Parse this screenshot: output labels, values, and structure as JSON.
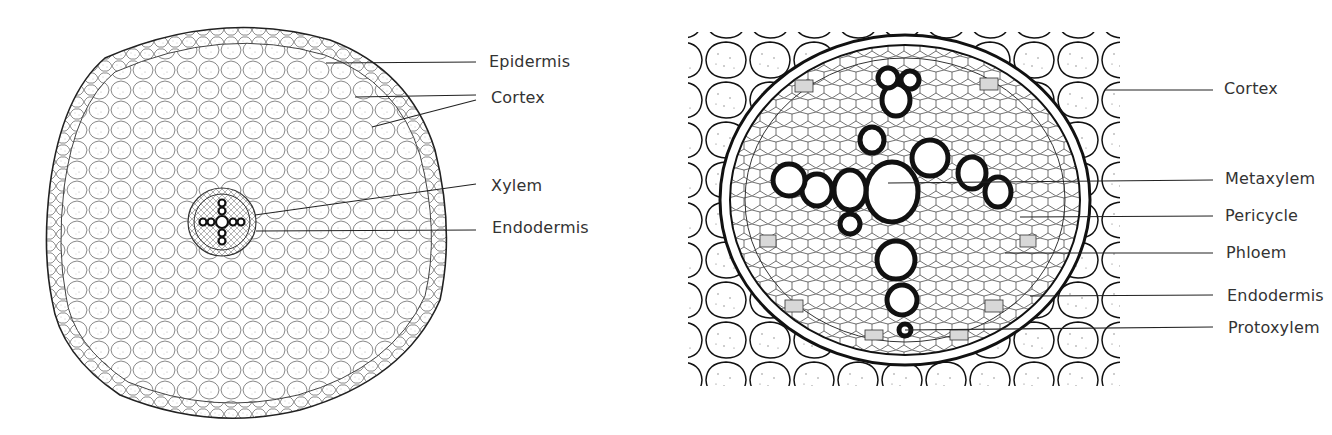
{
  "diagram": {
    "left_panel": {
      "subject": "root cross-section (whole)",
      "labels": [
        {
          "text": "Epidermis",
          "x": 489,
          "y": 54
        },
        {
          "text": "Cortex",
          "x": 491,
          "y": 90
        },
        {
          "text": "Xylem",
          "x": 491,
          "y": 178
        },
        {
          "text": "Endodermis",
          "x": 492,
          "y": 220
        }
      ]
    },
    "right_panel": {
      "subject": "vascular cylinder (enlarged)",
      "labels": [
        {
          "text": "Cortex",
          "x": 1224,
          "y": 81
        },
        {
          "text": "Metaxylem",
          "x": 1225,
          "y": 171
        },
        {
          "text": "Pericycle",
          "x": 1225,
          "y": 208
        },
        {
          "text": "Phloem",
          "x": 1226,
          "y": 245
        },
        {
          "text": "Endodermis",
          "x": 1227,
          "y": 288
        },
        {
          "text": "Protoxylem",
          "x": 1228,
          "y": 320
        }
      ]
    },
    "colors": {
      "ink": "#111111",
      "label_text": "#333333",
      "leader_line": "#222222",
      "background": "#ffffff"
    }
  }
}
